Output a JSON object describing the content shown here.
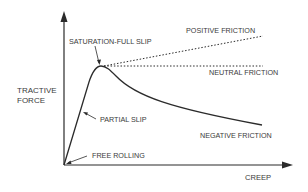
{
  "diagram": {
    "y_axis_label_line1": "TRACTIVE",
    "y_axis_label_line2": "FORCE",
    "x_axis_label": "CREEP",
    "annotations": {
      "saturation": "SATURATION-FULL SLIP",
      "positive": "POSITIVE FRICTION",
      "neutral": "NEUTRAL FRICTION",
      "negative": "NEGATIVE FRICTION",
      "partial_slip": "PARTIAL SLIP",
      "free_rolling": "FREE ROLLING"
    },
    "colors": {
      "line": "#2b2b2b",
      "text": "#3b3b3b",
      "background": "#ffffff"
    }
  }
}
